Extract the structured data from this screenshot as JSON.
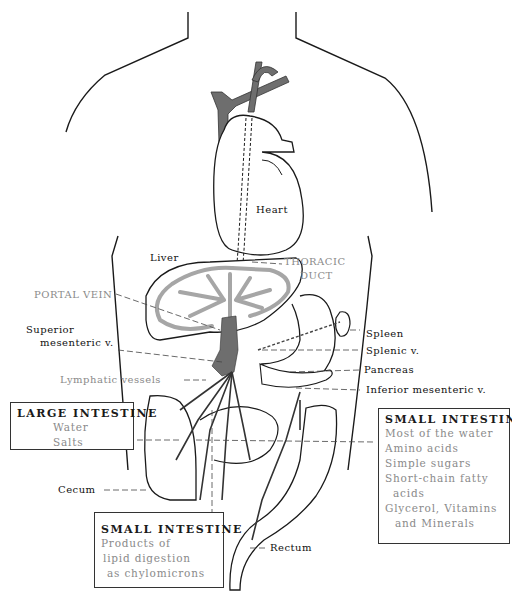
{
  "colors": {
    "outline": "#1a1a1a",
    "vessel_dark": "#6e6e6e",
    "vessel_light": "#a6a6a6",
    "label_gray": "#8a8a8a"
  },
  "labels": {
    "heart": "Heart",
    "liver": "Liver",
    "thoracic_duct_1": "THORACIC",
    "thoracic_duct_2": "DUCT",
    "portal_vein": "PORTAL VEIN",
    "superior_mesenteric_1": "Superior",
    "superior_mesenteric_2": "mesenteric v.",
    "lymphatic_vessels": "Lymphatic vessels",
    "spleen": "Spleen",
    "splenic_v": "Splenic v.",
    "pancreas": "Pancreas",
    "inferior_mesenteric_v": "Inferior mesenteric v.",
    "cecum": "Cecum",
    "rectum": "Rectum"
  },
  "boxes": {
    "large_intestine": {
      "title": "LARGE INTESTINE",
      "items": [
        "Water",
        "Salts"
      ]
    },
    "small_intestine_right": {
      "title": "SMALL INTESTINE",
      "items": [
        "Most of the water",
        "Amino acids",
        "Simple sugars",
        "Short-chain fatty",
        "  acids",
        "Glycerol, Vitamins",
        "  and Minerals"
      ]
    },
    "small_intestine_bottom": {
      "title": "SMALL INTESTINE",
      "items": [
        "Products of",
        "lipid digestion",
        "as chylomicrons"
      ]
    }
  }
}
